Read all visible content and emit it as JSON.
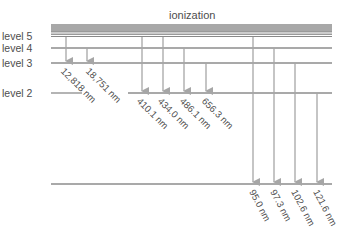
{
  "diagram": {
    "title": "ionization",
    "levels": [
      {
        "label": "level 5",
        "y": 36
      },
      {
        "label": "level 4",
        "y": 48
      },
      {
        "label": "level 3",
        "y": 63
      },
      {
        "label": "level 2",
        "y": 93
      },
      {
        "label": "",
        "y": 184
      }
    ],
    "colors": {
      "line": "#8c8c8c",
      "band": "#9a9a9a",
      "arrow": "#a6a6a6",
      "text": "#4d4d4d"
    },
    "series": {
      "paschen": [
        {
          "label": "12,818 nm",
          "from": "level 5",
          "to": "level 3"
        },
        {
          "label": "18,751 nm",
          "from": "level 4",
          "to": "level 3"
        }
      ],
      "balmer": [
        {
          "label": "410.1 nm",
          "from": "ionization",
          "to": "level 2"
        },
        {
          "label": "434.0 nm",
          "from": "level 5",
          "to": "level 2"
        },
        {
          "label": "486.1 nm",
          "from": "level 4",
          "to": "level 2"
        },
        {
          "label": "656.3 nm",
          "from": "level 3",
          "to": "level 2"
        }
      ],
      "lyman": [
        {
          "label": "95.0 nm",
          "from": "level 5",
          "to": "level 1"
        },
        {
          "label": "97.3 nm",
          "from": "level 4",
          "to": "level 1"
        },
        {
          "label": "102.6 nm",
          "from": "level 3",
          "to": "level 1"
        },
        {
          "label": "121.6 nm",
          "from": "level 2",
          "to": "level 1"
        }
      ]
    }
  }
}
